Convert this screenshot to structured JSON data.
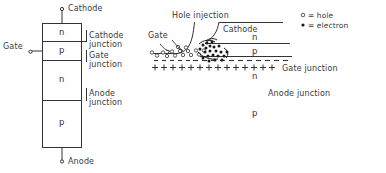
{
  "figure": {
    "background_color": "#ffffff",
    "line_color": "#333333",
    "text_color": "#3a3a3a"
  },
  "left_diagram": {
    "name": "four-layer-pnpn-structure",
    "terminals": {
      "top": "Cathode",
      "bottom": "Anode",
      "side": "Gate"
    },
    "layers": [
      {
        "label": "n"
      },
      {
        "label": "p"
      },
      {
        "label": "n"
      },
      {
        "label": "p"
      }
    ],
    "junction_labels": [
      {
        "line1": "Cathode",
        "line2": "junction"
      },
      {
        "line1": "Gate",
        "line2": "junction"
      },
      {
        "line1": "Anode",
        "line2": "junction"
      }
    ]
  },
  "right_diagram": {
    "name": "carrier-injection-cross-section",
    "annotations": {
      "hole_injection": "Hole injection",
      "gate": "Gate",
      "cathode": "Cathode",
      "gate_junction": "Gate junction",
      "anode_junction": "Anode junction"
    },
    "layers": [
      {
        "label": "n"
      },
      {
        "label": "p"
      },
      {
        "label": "n"
      },
      {
        "label": "p"
      }
    ],
    "charge_rows": {
      "negative": "- - - - - - - - - - - -",
      "positive": "+ + + + + + + + + + + + +"
    }
  },
  "legend": {
    "name": "carrier-legend",
    "items": [
      {
        "symbol": "o",
        "text": "= hole"
      },
      {
        "symbol": "•",
        "text": "= electron"
      }
    ]
  }
}
